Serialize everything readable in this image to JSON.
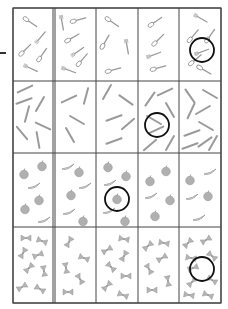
{
  "worksheet": {
    "grid": {
      "left": 13,
      "right": 221,
      "top": 8,
      "bottom": 303,
      "col_lines": [
        13,
        53,
        55,
        96,
        138,
        179,
        221
      ],
      "row_lines": [
        8,
        81,
        153,
        227,
        303
      ],
      "line_color": "#444444"
    },
    "item_color": "#9a9a9a",
    "circle_color": "#111111",
    "rows": [
      {
        "category": "cutlery",
        "cells": [
          {
            "items": [
              [
                "spoon",
                30,
                22,
                35
              ],
              [
                "fork",
                40,
                38,
                -50
              ],
              [
                "spoon",
                25,
                50,
                -45
              ],
              [
                "spoon",
                42,
                55,
                -55
              ],
              [
                "fork",
                30,
                68,
                25
              ]
            ]
          },
          {
            "items": [
              [
                "fork",
                62,
                22,
                80
              ],
              [
                "spoon",
                78,
                20,
                -15
              ],
              [
                "spoon",
                72,
                38,
                -30
              ],
              [
                "fork",
                77,
                52,
                -35
              ],
              [
                "spoon",
                82,
                60,
                -50
              ],
              [
                "fork",
                68,
                70,
                20
              ]
            ]
          },
          {
            "items": [
              [
                "spoon",
                112,
                22,
                35
              ],
              [
                "spoon",
                105,
                42,
                -60
              ],
              [
                "fork",
                127,
                46,
                80
              ],
              [
                "spoon",
                113,
                70,
                -15
              ]
            ]
          },
          {
            "items": [
              [
                "spoon",
                155,
                22,
                -35
              ],
              [
                "spoon",
                158,
                40,
                -45
              ],
              [
                "fork",
                153,
                55,
                -20
              ],
              [
                "spoon",
                158,
                68,
                -15
              ]
            ]
          },
          {
            "items": [
              [
                "fork",
                200,
                18,
                30
              ],
              [
                "spoon",
                193,
                36,
                -50
              ],
              [
                "spoon",
                210,
                36,
                -55
              ],
              [
                "fork",
                201,
                52,
                -20
              ],
              [
                "spoon",
                195,
                60,
                -40
              ],
              [
                "spoon",
                204,
                70,
                30
              ]
            ]
          }
        ],
        "circle": {
          "cx": 202,
          "cy": 50,
          "r": 12
        }
      },
      {
        "category": "pencils",
        "cells": [
          {
            "items": [
              [
                25,
                89,
                -25
              ],
              [
                24,
                101,
                -20
              ],
              [
                40,
                104,
                -60
              ],
              [
                27,
                114,
                -75
              ],
              [
                43,
                126,
                25
              ],
              [
                22,
                133,
                50
              ],
              [
                38,
                140,
                80
              ]
            ]
          },
          {
            "items": [
              [
                69,
                99,
                -25
              ],
              [
                86,
                96,
                -75
              ],
              [
                77,
                120,
                30
              ],
              [
                70,
                135,
                60
              ]
            ]
          },
          {
            "items": [
              [
                107,
                92,
                -60
              ],
              [
                126,
                100,
                35
              ],
              [
                114,
                118,
                -20
              ],
              [
                128,
                124,
                -40
              ],
              [
                114,
                141,
                -20
              ]
            ]
          },
          {
            "items": [
              [
                150,
                99,
                -55
              ],
              [
                165,
                92,
                -25
              ],
              [
                170,
                110,
                60
              ],
              [
                154,
                120,
                30
              ],
              [
                156,
                130,
                -25
              ],
              [
                150,
                145,
                -40
              ],
              [
                170,
                143,
                -60
              ]
            ]
          },
          {
            "items": [
              [
                190,
                96,
                55
              ],
              [
                210,
                94,
                30
              ],
              [
                191,
                111,
                -65
              ],
              [
                203,
                110,
                -30
              ],
              [
                206,
                126,
                30
              ],
              [
                192,
                133,
                -20
              ],
              [
                205,
                142,
                -35
              ],
              [
                190,
                146,
                -20
              ],
              [
                213,
                143,
                -60
              ]
            ]
          }
        ],
        "circle": {
          "cx": 157,
          "cy": 125,
          "r": 12
        }
      },
      {
        "category": "fruit",
        "cells": [
          {
            "items": [
              [
                "apple",
                24,
                174
              ],
              [
                "apple",
                42,
                166
              ],
              [
                "banana",
                34,
                186
              ],
              [
                "apple",
                39,
                200
              ],
              [
                "apple",
                25,
                209
              ],
              [
                "banana",
                44,
                220
              ]
            ]
          },
          {
            "items": [
              [
                "banana",
                68,
                167
              ],
              [
                "apple",
                79,
                172
              ],
              [
                "banana",
                85,
                186
              ],
              [
                "apple",
                71,
                195
              ],
              [
                "banana",
                69,
                212
              ],
              [
                "apple",
                83,
                221
              ]
            ]
          },
          {
            "items": [
              [
                "apple",
                108,
                167
              ],
              [
                "apple",
                126,
                176
              ],
              [
                "banana",
                110,
                183
              ],
              [
                "apple",
                117,
                199
              ],
              [
                "banana",
                109,
                211
              ],
              [
                "apple",
                125,
                221
              ]
            ]
          },
          {
            "items": [
              [
                "apple",
                150,
                181
              ],
              [
                "apple",
                166,
                171
              ],
              [
                "banana",
                151,
                196
              ],
              [
                "apple",
                170,
                200
              ],
              [
                "apple",
                155,
                216
              ]
            ]
          },
          {
            "items": [
              [
                "banana",
                210,
                172
              ],
              [
                "apple",
                190,
                180
              ],
              [
                "banana",
                192,
                197
              ],
              [
                "apple",
                208,
                196
              ],
              [
                "banana",
                199,
                218
              ]
            ]
          }
        ],
        "circle": {
          "cx": 117,
          "cy": 199,
          "r": 12
        }
      },
      {
        "category": "bows",
        "cells": [
          {
            "items": [
              [
                26,
                238,
                0
              ],
              [
                42,
                241,
                20
              ],
              [
                23,
                253,
                -60
              ],
              [
                38,
                255,
                -20
              ],
              [
                29,
                268,
                -45
              ],
              [
                44,
                271,
                80
              ],
              [
                22,
                287,
                -30
              ],
              [
                40,
                289,
                30
              ]
            ]
          },
          {
            "items": [
              [
                69,
                242,
                -60
              ],
              [
                84,
                258,
                20
              ],
              [
                66,
                268,
                80
              ],
              [
                80,
                279,
                60
              ],
              [
                68,
                292,
                0
              ]
            ]
          },
          {
            "items": [
              [
                124,
                239,
                10
              ],
              [
                107,
                250,
                -30
              ],
              [
                124,
                256,
                -60
              ],
              [
                111,
                267,
                45
              ],
              [
                126,
                276,
                0
              ],
              [
                107,
                286,
                -45
              ],
              [
                123,
                295,
                20
              ]
            ]
          },
          {
            "items": [
              [
                148,
                246,
                -40
              ],
              [
                164,
                243,
                10
              ],
              [
                162,
                258,
                -30
              ],
              [
                149,
                269,
                60
              ],
              [
                168,
                281,
                80
              ],
              [
                152,
                290,
                0
              ]
            ]
          },
          {
            "items": [
              [
                188,
                243,
                -45
              ],
              [
                206,
                240,
                -30
              ],
              [
                191,
                258,
                10
              ],
              [
                212,
                256,
                40
              ],
              [
                193,
                268,
                -20
              ],
              [
                212,
                280,
                30
              ],
              [
                192,
                282,
                -45
              ],
              [
                189,
                295,
                10
              ],
              [
                208,
                295,
                20
              ]
            ]
          }
        ],
        "circle": {
          "cx": 202,
          "cy": 269,
          "r": 12
        }
      }
    ]
  }
}
